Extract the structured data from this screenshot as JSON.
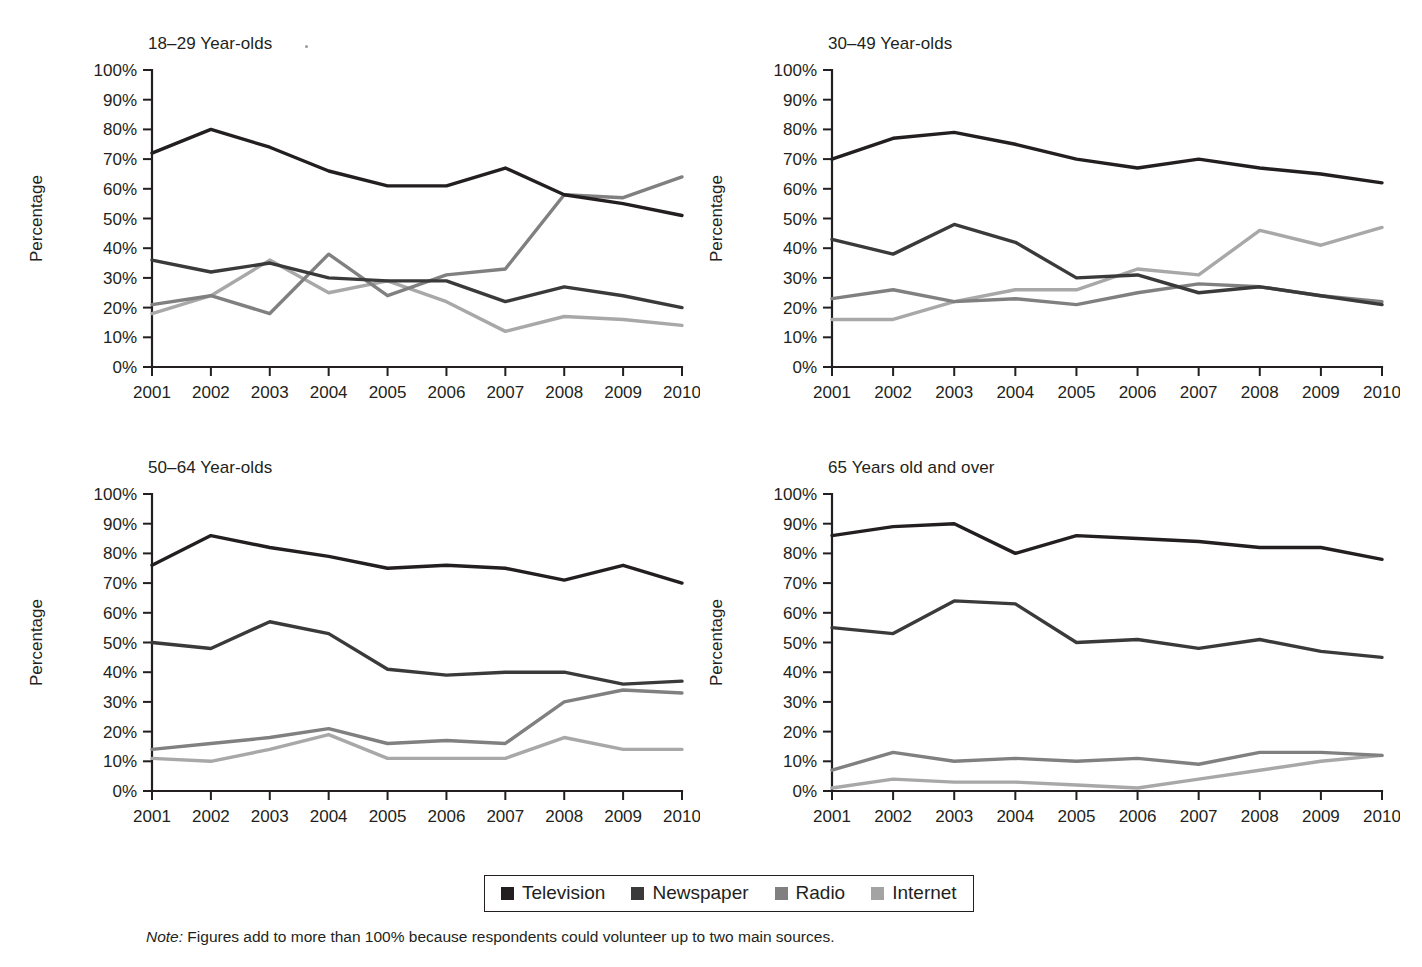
{
  "figure": {
    "note_prefix": "Note:",
    "note_text": " Figures add to more than 100% because respondents could volunteer up to two main sources."
  },
  "legend": {
    "items": [
      {
        "label": "Television",
        "color": "#231f20"
      },
      {
        "label": "Newspaper",
        "color": "#3a3a3a"
      },
      {
        "label": "Radio",
        "color": "#808080"
      },
      {
        "label": "Internet",
        "color": "#a3a3a3"
      }
    ]
  },
  "series_colors": {
    "Television": "#231f20",
    "Newspaper": "#3a3a3a",
    "Radio": "#808080",
    "Internet": "#a8a8a8"
  },
  "chart_data": [
    {
      "type": "line",
      "title": "18–29 Year-olds",
      "xlabel": "",
      "ylabel": "Percentage",
      "x": [
        "2001",
        "2002",
        "2003",
        "2004",
        "2005",
        "2006",
        "2007",
        "2008",
        "2009",
        "2010"
      ],
      "ylim": [
        0,
        100
      ],
      "yticks": [
        "0%",
        "10%",
        "20%",
        "30%",
        "40%",
        "50%",
        "60%",
        "70%",
        "80%",
        "90%",
        "100%"
      ],
      "grid": false,
      "legend_position": "bottom-shared",
      "series": [
        {
          "name": "Television",
          "values": [
            72,
            80,
            74,
            66,
            61,
            61,
            67,
            58,
            55,
            51
          ]
        },
        {
          "name": "Newspaper",
          "values": [
            36,
            32,
            35,
            30,
            29,
            29,
            22,
            27,
            24,
            20
          ]
        },
        {
          "name": "Radio",
          "values": [
            21,
            24,
            18,
            38,
            24,
            31,
            33,
            58,
            57,
            64
          ]
        },
        {
          "name": "Internet",
          "values": [
            18,
            24,
            36,
            25,
            29,
            22,
            12,
            17,
            16,
            14
          ]
        }
      ]
    },
    {
      "type": "line",
      "title": "30–49 Year-olds",
      "xlabel": "",
      "ylabel": "Percentage",
      "x": [
        "2001",
        "2002",
        "2003",
        "2004",
        "2005",
        "2006",
        "2007",
        "2008",
        "2009",
        "2010"
      ],
      "ylim": [
        0,
        100
      ],
      "yticks": [
        "0%",
        "10%",
        "20%",
        "30%",
        "40%",
        "50%",
        "60%",
        "70%",
        "80%",
        "90%",
        "100%"
      ],
      "grid": false,
      "legend_position": "bottom-shared",
      "series": [
        {
          "name": "Television",
          "values": [
            70,
            77,
            79,
            75,
            70,
            67,
            70,
            67,
            65,
            62
          ]
        },
        {
          "name": "Newspaper",
          "values": [
            43,
            38,
            48,
            42,
            30,
            31,
            25,
            27,
            24,
            21
          ]
        },
        {
          "name": "Radio",
          "values": [
            23,
            26,
            22,
            23,
            21,
            25,
            28,
            27,
            24,
            22
          ]
        },
        {
          "name": "Internet",
          "values": [
            16,
            16,
            22,
            26,
            26,
            33,
            31,
            46,
            41,
            47
          ]
        }
      ]
    },
    {
      "type": "line",
      "title": "50–64 Year-olds",
      "xlabel": "",
      "ylabel": "Percentage",
      "x": [
        "2001",
        "2002",
        "2003",
        "2004",
        "2005",
        "2006",
        "2007",
        "2008",
        "2009",
        "2010"
      ],
      "ylim": [
        0,
        100
      ],
      "yticks": [
        "0%",
        "10%",
        "20%",
        "30%",
        "40%",
        "50%",
        "60%",
        "70%",
        "80%",
        "90%",
        "100%"
      ],
      "grid": false,
      "legend_position": "bottom-shared",
      "series": [
        {
          "name": "Television",
          "values": [
            76,
            86,
            82,
            79,
            75,
            76,
            75,
            71,
            76,
            70
          ]
        },
        {
          "name": "Newspaper",
          "values": [
            50,
            48,
            57,
            53,
            41,
            39,
            40,
            40,
            36,
            37
          ]
        },
        {
          "name": "Radio",
          "values": [
            14,
            16,
            18,
            21,
            16,
            17,
            16,
            30,
            34,
            33
          ]
        },
        {
          "name": "Internet",
          "values": [
            11,
            10,
            14,
            19,
            11,
            11,
            11,
            18,
            14,
            14
          ]
        }
      ]
    },
    {
      "type": "line",
      "title": "65 Years old and over",
      "xlabel": "",
      "ylabel": "Percentage",
      "x": [
        "2001",
        "2002",
        "2003",
        "2004",
        "2005",
        "2006",
        "2007",
        "2008",
        "2009",
        "2010"
      ],
      "ylim": [
        0,
        100
      ],
      "yticks": [
        "0%",
        "10%",
        "20%",
        "30%",
        "40%",
        "50%",
        "60%",
        "70%",
        "80%",
        "90%",
        "100%"
      ],
      "grid": false,
      "legend_position": "bottom-shared",
      "series": [
        {
          "name": "Television",
          "values": [
            86,
            89,
            90,
            80,
            86,
            85,
            84,
            82,
            82,
            78
          ]
        },
        {
          "name": "Newspaper",
          "values": [
            55,
            53,
            64,
            63,
            50,
            51,
            48,
            51,
            47,
            45
          ]
        },
        {
          "name": "Radio",
          "values": [
            7,
            13,
            10,
            11,
            10,
            11,
            9,
            13,
            13,
            12
          ]
        },
        {
          "name": "Internet",
          "values": [
            1,
            4,
            3,
            3,
            2,
            1,
            4,
            7,
            10,
            12
          ]
        }
      ]
    }
  ]
}
